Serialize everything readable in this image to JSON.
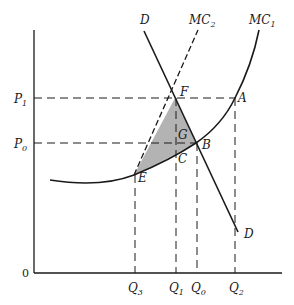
{
  "figure": {
    "type": "economics-diagram",
    "axes": {
      "origin_label": "0"
    },
    "curves": [
      {
        "name": "D",
        "label": "D",
        "style": "solid"
      },
      {
        "name": "MC2",
        "label": "MC",
        "sub": "2",
        "style": "dashed"
      },
      {
        "name": "MC1",
        "label": "MC",
        "sub": "1",
        "style": "solid"
      }
    ],
    "price_labels": [
      {
        "label": "P",
        "sub": "1"
      },
      {
        "label": "P",
        "sub": "0"
      }
    ],
    "quantity_labels": [
      {
        "label": "Q",
        "sub": "3"
      },
      {
        "label": "Q",
        "sub": "1"
      },
      {
        "label": "Q",
        "sub": "0"
      },
      {
        "label": "Q",
        "sub": "2"
      }
    ],
    "points": {
      "F": "F",
      "A": "A",
      "G": "G",
      "B": "B",
      "C": "C",
      "E": "E",
      "D_end": "D"
    },
    "shaded_region": {
      "vertices": [
        "F",
        "B",
        "E"
      ],
      "color": "#b3b3b3"
    },
    "line_color": "#1a1a1a"
  }
}
